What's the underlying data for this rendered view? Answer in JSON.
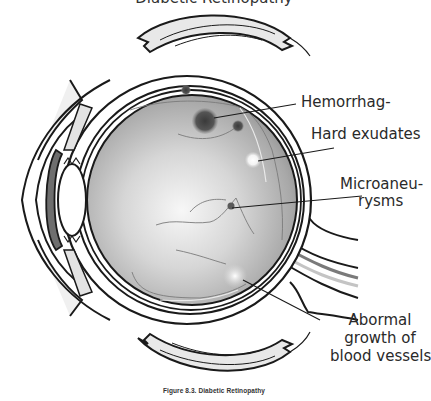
{
  "figure": {
    "title_partial": "Diabetic Retinopathy",
    "caption": "Figure 8.3. Diabetic Retinopathy",
    "labels": {
      "hemorrhage": "Hemorrhag-",
      "hard_exudates": "Hard exudates",
      "microaneurysms_line1": "Microaneu-",
      "microaneurysms_line2": "rysms",
      "abnormal_line1": "Abormal",
      "abnormal_line2": "growth of",
      "abnormal_line3": "blood vessels"
    },
    "parts": [
      "eyelid-upper",
      "eyelid-lower",
      "extraocular-muscle-upper",
      "extraocular-muscle-lower",
      "cornea",
      "iris",
      "lens",
      "sclera",
      "choroid",
      "retina",
      "optic-nerve",
      "hemorrhages",
      "hard-exudate",
      "microaneurysm",
      "neovascularization"
    ],
    "colors": {
      "outline": "#1a1a1a",
      "vitreous_light": "#f2f2f2",
      "vitreous_dark": "#8a8a8a",
      "muscle_fill": "#e6e6e6",
      "iris_fill": "#6e6e6e",
      "hemorrhage": "#4a4a4a",
      "exudate": "#ffffff"
    }
  }
}
